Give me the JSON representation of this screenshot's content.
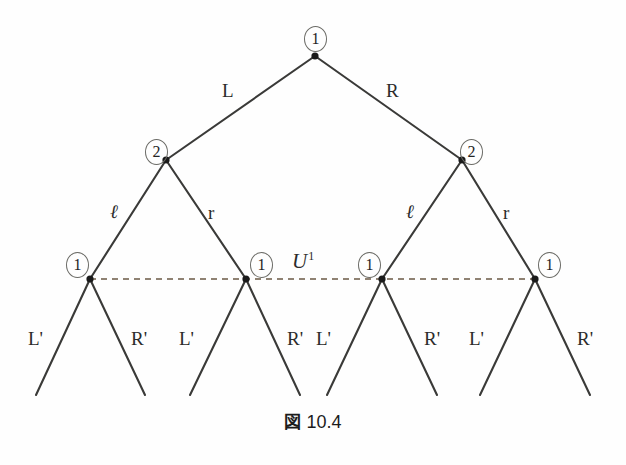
{
  "figure": {
    "caption_mark": "図",
    "caption_number": "10.4",
    "colors": {
      "edge": "#3a3a38",
      "node_dot": "#1a1a1a",
      "badge_border": "#6b6b66",
      "cut_line": "#6b5a45",
      "text": "#2b2b2b",
      "background": "#fefefe"
    }
  },
  "nodes": [
    {
      "id": "root",
      "label": "1",
      "x": 315,
      "y": 56,
      "badge_x": 304,
      "badge_y": 26
    },
    {
      "id": "n-l",
      "label": "2",
      "x": 166,
      "y": 160,
      "badge_x": 145,
      "badge_y": 139
    },
    {
      "id": "n-r",
      "label": "2",
      "x": 462,
      "y": 160,
      "badge_x": 460,
      "badge_y": 139
    },
    {
      "id": "n-ll",
      "label": "1",
      "x": 90,
      "y": 279,
      "badge_x": 66,
      "badge_y": 252
    },
    {
      "id": "n-lr",
      "label": "1",
      "x": 246,
      "y": 279,
      "badge_x": 250,
      "badge_y": 252
    },
    {
      "id": "n-rl",
      "label": "1",
      "x": 382,
      "y": 279,
      "badge_x": 358,
      "badge_y": 252
    },
    {
      "id": "n-rr",
      "label": "1",
      "x": 535,
      "y": 279,
      "badge_x": 538,
      "badge_y": 252
    }
  ],
  "edges": [
    {
      "from": "root",
      "to": "n-l",
      "label": "L"
    },
    {
      "from": "root",
      "to": "n-r",
      "label": "R"
    },
    {
      "from": "n-l",
      "to": "n-ll",
      "label": "ℓ"
    },
    {
      "from": "n-l",
      "to": "n-lr",
      "label": "r"
    },
    {
      "from": "n-r",
      "to": "n-rl",
      "label": "ℓ"
    },
    {
      "from": "n-r",
      "to": "n-rr",
      "label": "r"
    }
  ],
  "edge_labels": [
    {
      "name": "edge-label-L",
      "text": "L",
      "x": 222,
      "y": 80,
      "script": false
    },
    {
      "name": "edge-label-R",
      "text": "R",
      "x": 386,
      "y": 80,
      "script": false
    },
    {
      "name": "edge-label-ell-1",
      "text": "ℓ",
      "x": 110,
      "y": 202,
      "script": true
    },
    {
      "name": "edge-label-r-1",
      "text": "r",
      "x": 208,
      "y": 202,
      "script": false
    },
    {
      "name": "edge-label-ell-2",
      "text": "ℓ",
      "x": 406,
      "y": 202,
      "script": true
    },
    {
      "name": "edge-label-r-2",
      "text": "r",
      "x": 503,
      "y": 202,
      "script": false
    }
  ],
  "leaf_edges": [
    {
      "label": "L'",
      "from_x": 90,
      "from_y": 279,
      "to_x": 36,
      "to_y": 395,
      "label_x": 28,
      "label_y": 328
    },
    {
      "label": "R'",
      "from_x": 90,
      "from_y": 279,
      "to_x": 145,
      "to_y": 395,
      "label_x": 131,
      "label_y": 328
    },
    {
      "label": "L'",
      "from_x": 246,
      "from_y": 279,
      "to_x": 190,
      "to_y": 395,
      "label_x": 179,
      "label_y": 328
    },
    {
      "label": "R'",
      "from_x": 246,
      "from_y": 279,
      "to_x": 300,
      "to_y": 395,
      "label_x": 287,
      "label_y": 328
    },
    {
      "label": "L'",
      "from_x": 382,
      "from_y": 279,
      "to_x": 327,
      "to_y": 395,
      "label_x": 316,
      "label_y": 328
    },
    {
      "label": "R'",
      "from_x": 382,
      "from_y": 279,
      "to_x": 437,
      "to_y": 395,
      "label_x": 424,
      "label_y": 328
    },
    {
      "label": "L'",
      "from_x": 535,
      "from_y": 279,
      "to_x": 480,
      "to_y": 395,
      "label_x": 469,
      "label_y": 328
    },
    {
      "label": "R'",
      "from_x": 535,
      "from_y": 279,
      "to_x": 590,
      "to_y": 395,
      "label_x": 577,
      "label_y": 328
    }
  ],
  "cut": {
    "name": "cut-line-U1",
    "label_base": "U",
    "label_sup": "1",
    "label_x": 292,
    "label_y": 249,
    "line_y": 279,
    "x_start": 90,
    "x_end": 535,
    "style": "dashed"
  }
}
